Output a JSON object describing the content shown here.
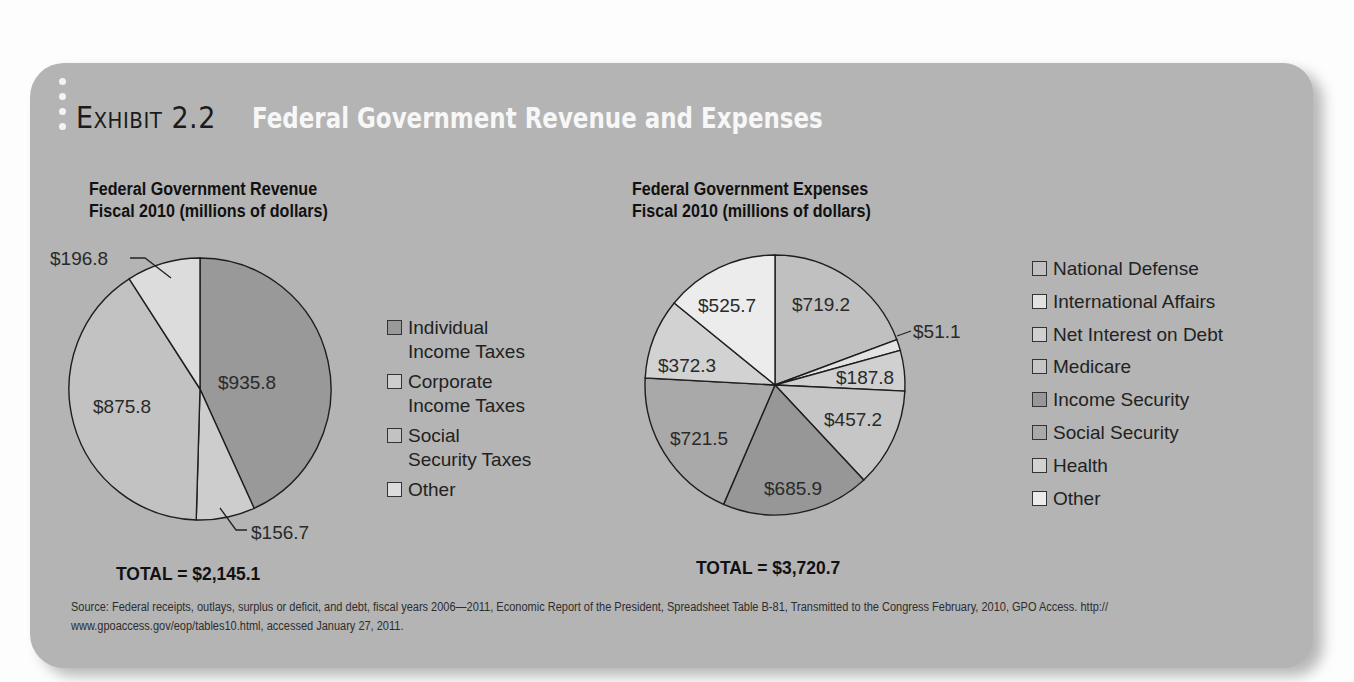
{
  "exhibit": {
    "label": "Exhibit",
    "number": "2.2",
    "title": "Federal Government Revenue and Expenses"
  },
  "revenue": {
    "subtitle_line1": "Federal Government Revenue",
    "subtitle_line2": "Fiscal 2010 (millions of dollars)",
    "total": "TOTAL = $2,145.1",
    "legend": [
      {
        "label": "Individual Income Taxes",
        "line1": "Individual",
        "line2": "Income Taxes",
        "color": "#999999"
      },
      {
        "label": "Corporate Income Taxes",
        "line1": "Corporate",
        "line2": "Income Taxes",
        "color": "#cdcdcd"
      },
      {
        "label": "Social Security Taxes",
        "line1": "Social",
        "line2": "Security Taxes",
        "color": "#c2c2c2"
      },
      {
        "label": "Other",
        "line1": "Other",
        "line2": "",
        "color": "#dcdcdc"
      }
    ],
    "slice_labels": [
      "$935.8",
      "$156.7",
      "$875.8",
      "$196.8"
    ]
  },
  "expenses": {
    "subtitle_line1": "Federal Government Expenses",
    "subtitle_line2": "Fiscal 2010 (millions of dollars)",
    "total": "TOTAL = $3,720.7",
    "legend": [
      {
        "label": "National Defense",
        "color": "#c0c0c0"
      },
      {
        "label": "International Affairs",
        "color": "#e2e2e2"
      },
      {
        "label": "Net Interest on Debt",
        "color": "#d0d0d0"
      },
      {
        "label": "Medicare",
        "color": "#c6c6c6"
      },
      {
        "label": "Income Security",
        "color": "#979797"
      },
      {
        "label": "Social Security",
        "color": "#a9a9a9"
      },
      {
        "label": "Health",
        "color": "#d2d2d2"
      },
      {
        "label": "Other",
        "color": "#ececec"
      }
    ],
    "slice_labels": [
      "$719.2",
      "$51.1",
      "$187.8",
      "$457.2",
      "$685.9",
      "$721.5",
      "$372.3",
      "$525.7"
    ]
  },
  "source": "Source: Federal receipts, outlays, surplus or deficit, and debt, fiscal years 2006—2011, Economic Report of the President, Spreadsheet Table B-81, Transmitted to the Congress February, 2010, GPO Access. http:// www.gpoaccess.gov/eop/tables10.html, accessed January 27, 2011.",
  "chart_data": [
    {
      "type": "pie",
      "title": "Federal Government Revenue Fiscal 2010 (millions of dollars)",
      "categories": [
        "Individual Income Taxes",
        "Corporate Income Taxes",
        "Social Security Taxes",
        "Other"
      ],
      "values": [
        935.8,
        156.7,
        875.8,
        196.8
      ],
      "labels": [
        "$935.8",
        "$156.7",
        "$875.8",
        "$196.8"
      ],
      "total_label": "TOTAL = $2,145.1",
      "legend_position": "right"
    },
    {
      "type": "pie",
      "title": "Federal Government Expenses Fiscal 2010 (millions of dollars)",
      "categories": [
        "National Defense",
        "International Affairs",
        "Net Interest on Debt",
        "Medicare",
        "Income Security",
        "Social Security",
        "Health",
        "Other"
      ],
      "values": [
        719.2,
        51.1,
        187.8,
        457.2,
        685.9,
        721.5,
        372.3,
        525.7
      ],
      "labels": [
        "$719.2",
        "$51.1",
        "$187.8",
        "$457.2",
        "$685.9",
        "$721.5",
        "$372.3",
        "$525.7"
      ],
      "total_label": "TOTAL = $3,720.7",
      "legend_position": "right"
    }
  ]
}
